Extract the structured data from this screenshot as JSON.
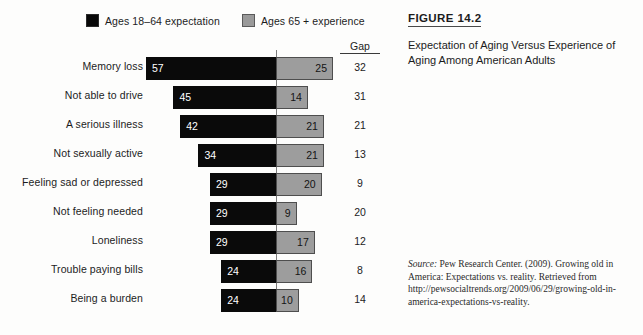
{
  "legend": {
    "items": [
      {
        "label": "Ages 18–64 expectation",
        "color": "#0a0a0a",
        "key": "expectation"
      },
      {
        "label": "Ages 65 + experience",
        "color": "#9d9d9d",
        "key": "experience"
      }
    ]
  },
  "gap_column": {
    "header": "Gap"
  },
  "caption": {
    "figure_number": "FIGURE 14.2",
    "title": "Expectation of Aging Versus Experience of Aging Among American Adults",
    "source_label": "Source:",
    "source_text": " Pew Research Center. (2009). Growing old in America: Expectations vs. reality. Retrieved from http://pewsocialtrends.org/2009/06/29/growing-old-in-america-expectations-vs-reality."
  },
  "chart_data": {
    "type": "bar",
    "title": "Expectation of Aging Versus Experience of Aging Among American Adults",
    "subtitle": "FIGURE 14.2",
    "orientation": "horizontal-diverging",
    "xlabel": "",
    "ylabel": "",
    "grid": false,
    "legend_position": "top",
    "axis_center_label": "0",
    "units": "percent",
    "categories": [
      "Memory loss",
      "Not able to drive",
      "A serious illness",
      "Not sexually active",
      "Feeling sad or depressed",
      "Not feeling needed",
      "Loneliness",
      "Trouble paying bills",
      "Being a burden"
    ],
    "series": [
      {
        "name": "Ages 18–64 expectation",
        "color": "#0a0a0a",
        "side": "left",
        "values": [
          57,
          45,
          42,
          34,
          29,
          29,
          29,
          24,
          24
        ]
      },
      {
        "name": "Ages 65 + experience",
        "color": "#9d9d9d",
        "side": "right",
        "values": [
          25,
          14,
          21,
          21,
          20,
          9,
          17,
          16,
          10
        ]
      }
    ],
    "gaps": [
      32,
      31,
      21,
      13,
      9,
      20,
      12,
      8,
      14
    ],
    "xlim": [
      0,
      60
    ],
    "px_per_unit": 2.28
  }
}
